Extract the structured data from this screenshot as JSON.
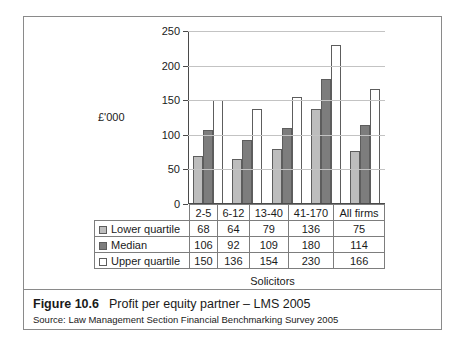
{
  "figure": {
    "number_label": "Figure 10.6",
    "title": "Profit per equity partner – LMS 2005",
    "source": "Source: Law Management Section Financial Benchmarking Survey 2005"
  },
  "chart_data": {
    "type": "bar",
    "title": "Profit per equity partner – LMS 2005",
    "xlabel": "Solicitors",
    "ylabel": "£'000",
    "categories": [
      "2-5",
      "6-12",
      "13-40",
      "41-170",
      "All firms"
    ],
    "series": [
      {
        "name": "Lower quartile",
        "color": "#bdbdbd",
        "values": [
          68,
          64,
          79,
          136,
          75
        ]
      },
      {
        "name": "Median",
        "color": "#7d7d7d",
        "values": [
          106,
          92,
          109,
          180,
          114
        ]
      },
      {
        "name": "Upper quartile",
        "color": "#ffffff",
        "values": [
          150,
          136,
          154,
          230,
          166
        ]
      }
    ],
    "ylim": [
      0,
      250
    ],
    "yticks": [
      0,
      50,
      100,
      150,
      200,
      250
    ],
    "ytick_labels": [
      "0",
      "50",
      "100",
      "150",
      "200",
      "250"
    ],
    "grid": true,
    "legend_position": "table-row-headers"
  },
  "table": {
    "column_headers": [
      "2-5",
      "6-12",
      "13-40",
      "41-170",
      "All firms"
    ],
    "rows": [
      {
        "label": "Lower quartile",
        "swatch": "lower",
        "cells": [
          "68",
          "64",
          "79",
          "136",
          "75"
        ]
      },
      {
        "label": "Median",
        "swatch": "median",
        "cells": [
          "106",
          "92",
          "109",
          "180",
          "114"
        ]
      },
      {
        "label": "Upper quartile",
        "swatch": "upper",
        "cells": [
          "150",
          "136",
          "154",
          "230",
          "166"
        ]
      }
    ]
  }
}
